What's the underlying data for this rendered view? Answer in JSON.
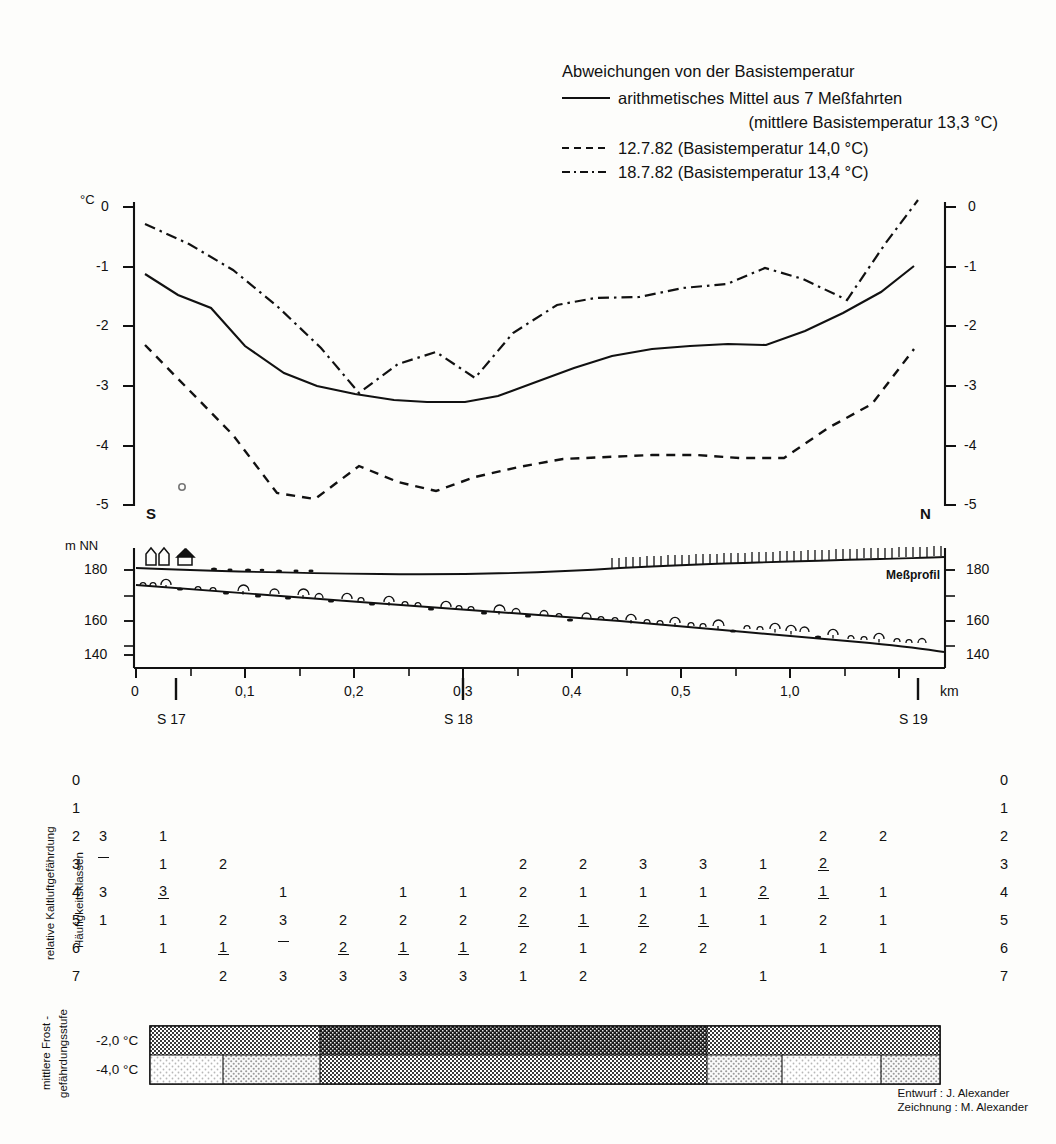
{
  "legend": {
    "title": "Abweichungen von der Basistemperatur",
    "entries": [
      {
        "style": "solid",
        "label": "arithmetisches Mittel aus 7 Meßfahrten",
        "sublabel": "(mittlere Basistemperatur 13,3 °C)"
      },
      {
        "style": "dashed",
        "label": "12.7.82 (Basistemperatur 14,0 °C)",
        "sublabel": ""
      },
      {
        "style": "dashdot",
        "label": "18.7.82 (Basistemperatur 13,4 °C)",
        "sublabel": ""
      }
    ]
  },
  "temp_panel": {
    "unit_label": "°C",
    "y_ticks_left": [
      "0",
      "-1",
      "-2",
      "-3",
      "-4",
      "-5"
    ],
    "y_ticks_right": [
      "0",
      "-1",
      "-2",
      "-3",
      "-4",
      "-5"
    ],
    "direction_left": "S",
    "direction_right": "N"
  },
  "profile_panel": {
    "unit_label": "m NN",
    "y_ticks_left": [
      "180",
      "160",
      "140"
    ],
    "y_ticks_right": [
      "180",
      "160",
      "140"
    ],
    "profile_label": "Meßprofil"
  },
  "x_axis": {
    "unit": "km",
    "ticks": [
      {
        "value": 0,
        "label": "0"
      },
      {
        "value": 0.1,
        "label": "0,1"
      },
      {
        "value": 0.2,
        "label": "0,2"
      },
      {
        "value": 0.3,
        "label": "0,3"
      },
      {
        "value": 0.4,
        "label": "0,4"
      },
      {
        "value": 0.5,
        "label": "0,5"
      },
      {
        "value": 1.0,
        "label": "1,0"
      }
    ],
    "stations": [
      {
        "label": "S 17",
        "value": 0.07
      },
      {
        "label": "S 18",
        "value": 0.565
      },
      {
        "label": "S 19",
        "value": 1.39
      }
    ]
  },
  "freq_table": {
    "side_label_outer": "relative Kaltluftgefährdung",
    "side_label_inner": "Häufigkeitsklassen",
    "row_labels": [
      "0",
      "1",
      "2",
      "3",
      "4",
      "5",
      "6",
      "7"
    ],
    "columns": 16,
    "cells": [
      {
        "row": 2,
        "col": 0,
        "type": "int",
        "value": "3"
      },
      {
        "row": 2,
        "col": 1,
        "type": "int",
        "value": "1"
      },
      {
        "row": 2,
        "col": 12,
        "type": "int",
        "value": "2"
      },
      {
        "row": 2,
        "col": 13,
        "type": "int",
        "value": "2"
      },
      {
        "row": 3,
        "col": 0,
        "type": "fracnum",
        "num": "",
        "den": ""
      },
      {
        "row": 3,
        "col": 1,
        "type": "int",
        "value": "1"
      },
      {
        "row": 3,
        "col": 2,
        "type": "int",
        "value": "2"
      },
      {
        "row": 3,
        "col": 7,
        "type": "int",
        "value": "2"
      },
      {
        "row": 3,
        "col": 8,
        "type": "int",
        "value": "2"
      },
      {
        "row": 3,
        "col": 9,
        "type": "int",
        "value": "3"
      },
      {
        "row": 3,
        "col": 10,
        "type": "int",
        "value": "3"
      },
      {
        "row": 3,
        "col": 11,
        "type": "int",
        "value": "1"
      },
      {
        "row": 3,
        "col": 12,
        "type": "fracnum",
        "num": "2",
        "den": ""
      },
      {
        "row": 3,
        "col": 13,
        "type": "int",
        "value": ""
      },
      {
        "row": 4,
        "col": 0,
        "type": "int",
        "value": "3"
      },
      {
        "row": 4,
        "col": 1,
        "type": "fracnum",
        "num": "3",
        "den": ""
      },
      {
        "row": 4,
        "col": 3,
        "type": "int",
        "value": "1"
      },
      {
        "row": 4,
        "col": 5,
        "type": "int",
        "value": "1"
      },
      {
        "row": 4,
        "col": 6,
        "type": "int",
        "value": "1"
      },
      {
        "row": 4,
        "col": 7,
        "type": "int",
        "value": "2"
      },
      {
        "row": 4,
        "col": 8,
        "type": "int",
        "value": "1"
      },
      {
        "row": 4,
        "col": 9,
        "type": "int",
        "value": "1"
      },
      {
        "row": 4,
        "col": 10,
        "type": "int",
        "value": "1"
      },
      {
        "row": 4,
        "col": 11,
        "type": "fracnum",
        "num": "2",
        "den": ""
      },
      {
        "row": 4,
        "col": 12,
        "type": "fracnum",
        "num": "1",
        "den": ""
      },
      {
        "row": 4,
        "col": 13,
        "type": "int",
        "value": "1"
      },
      {
        "row": 5,
        "col": 0,
        "type": "int",
        "value": "1"
      },
      {
        "row": 5,
        "col": 1,
        "type": "int",
        "value": "1"
      },
      {
        "row": 5,
        "col": 2,
        "type": "int",
        "value": "2"
      },
      {
        "row": 5,
        "col": 3,
        "type": "int",
        "value": "3"
      },
      {
        "row": 5,
        "col": 4,
        "type": "int",
        "value": "2"
      },
      {
        "row": 5,
        "col": 5,
        "type": "int",
        "value": "2"
      },
      {
        "row": 5,
        "col": 6,
        "type": "int",
        "value": "2"
      },
      {
        "row": 5,
        "col": 7,
        "type": "fracnum",
        "num": "2",
        "den": ""
      },
      {
        "row": 5,
        "col": 8,
        "type": "fracnum",
        "num": "1",
        "den": ""
      },
      {
        "row": 5,
        "col": 9,
        "type": "fracnum",
        "num": "2",
        "den": ""
      },
      {
        "row": 5,
        "col": 10,
        "type": "fracnum",
        "num": "1",
        "den": ""
      },
      {
        "row": 5,
        "col": 11,
        "type": "int",
        "value": "1"
      },
      {
        "row": 5,
        "col": 12,
        "type": "int",
        "value": "2"
      },
      {
        "row": 5,
        "col": 13,
        "type": "int",
        "value": "1"
      },
      {
        "row": 6,
        "col": 1,
        "type": "int",
        "value": "1"
      },
      {
        "row": 6,
        "col": 2,
        "type": "fracnum",
        "num": "1",
        "den": ""
      },
      {
        "row": 6,
        "col": 3,
        "type": "fracnum",
        "num": "",
        "den": ""
      },
      {
        "row": 6,
        "col": 4,
        "type": "fracnum",
        "num": "2",
        "den": ""
      },
      {
        "row": 6,
        "col": 5,
        "type": "fracnum",
        "num": "1",
        "den": ""
      },
      {
        "row": 6,
        "col": 6,
        "type": "fracnum",
        "num": "1",
        "den": ""
      },
      {
        "row": 6,
        "col": 7,
        "type": "int",
        "value": "2"
      },
      {
        "row": 6,
        "col": 8,
        "type": "int",
        "value": "1"
      },
      {
        "row": 6,
        "col": 9,
        "type": "int",
        "value": "2"
      },
      {
        "row": 6,
        "col": 10,
        "type": "int",
        "value": "2"
      },
      {
        "row": 6,
        "col": 12,
        "type": "int",
        "value": "1"
      },
      {
        "row": 6,
        "col": 13,
        "type": "int",
        "value": "1"
      },
      {
        "row": 7,
        "col": 2,
        "type": "int",
        "value": "2"
      },
      {
        "row": 7,
        "col": 3,
        "type": "int",
        "value": "3"
      },
      {
        "row": 7,
        "col": 4,
        "type": "int",
        "value": "3"
      },
      {
        "row": 7,
        "col": 5,
        "type": "int",
        "value": "3"
      },
      {
        "row": 7,
        "col": 6,
        "type": "int",
        "value": "3"
      },
      {
        "row": 7,
        "col": 7,
        "type": "int",
        "value": "1"
      },
      {
        "row": 7,
        "col": 8,
        "type": "int",
        "value": "2"
      },
      {
        "row": 7,
        "col": 11,
        "type": "int",
        "value": "1"
      }
    ]
  },
  "frost_panel": {
    "side_label": "mittlere Frost -\ngefährdungsstufe",
    "row_labels": [
      "-2,0 °C",
      "-4,0 °C"
    ],
    "top_segments": [
      {
        "start": 0.0,
        "end": 0.215,
        "shade": "mid"
      },
      {
        "start": 0.215,
        "end": 0.705,
        "shade": "dark"
      },
      {
        "start": 0.705,
        "end": 1.0,
        "shade": "mid"
      }
    ],
    "bottom_segments": [
      {
        "start": 0.0,
        "end": 0.092,
        "shade": "light"
      },
      {
        "start": 0.092,
        "end": 0.215,
        "shade": "light2"
      },
      {
        "start": 0.215,
        "end": 0.705,
        "shade": "mid"
      },
      {
        "start": 0.705,
        "end": 0.8,
        "shade": "light2"
      },
      {
        "start": 0.8,
        "end": 0.925,
        "shade": "light"
      },
      {
        "start": 0.925,
        "end": 1.0,
        "shade": "light2"
      }
    ]
  },
  "credits": {
    "line1": "Entwurf : J. Alexander",
    "line2": "Zeichnung : M. Alexander"
  },
  "chart_data": {
    "type": "line",
    "title": "Abweichungen von der Basistemperatur",
    "xlabel": "km",
    "ylabel": "°C",
    "xlim": [
      0,
      1.48
    ],
    "ylim": [
      -5.3,
      0.3
    ],
    "grid": false,
    "legend_position": "top-right",
    "series": [
      {
        "name": "arithmetisches Mittel aus 7 Meßfahrten",
        "style": "solid",
        "base_temperature": 13.3,
        "x": [
          0.02,
          0.08,
          0.14,
          0.2,
          0.27,
          0.33,
          0.4,
          0.47,
          0.53,
          0.6,
          0.66,
          0.73,
          0.8,
          0.87,
          0.94,
          1.01,
          1.08,
          1.15,
          1.22,
          1.29,
          1.36,
          1.42
        ],
        "y": [
          -1.12,
          -1.48,
          -1.7,
          -2.35,
          -2.8,
          -3.02,
          -3.15,
          -3.25,
          -3.28,
          -3.28,
          -3.18,
          -2.95,
          -2.72,
          -2.52,
          -2.4,
          -2.35,
          -2.32,
          -2.33,
          -2.1,
          -1.8,
          -1.45,
          -1.0
        ]
      },
      {
        "name": "12.7.82",
        "style": "dashed",
        "base_temperature": 14.0,
        "x": [
          0.02,
          0.1,
          0.18,
          0.26,
          0.33,
          0.41,
          0.48,
          0.55,
          0.62,
          0.7,
          0.78,
          0.86,
          0.94,
          1.02,
          1.1,
          1.18,
          1.26,
          1.34,
          1.42
        ],
        "y": [
          -2.3,
          -3.05,
          -3.8,
          -4.78,
          -4.88,
          -4.32,
          -4.6,
          -4.75,
          -4.52,
          -4.35,
          -4.22,
          -4.18,
          -4.15,
          -4.15,
          -4.2,
          -4.2,
          -3.7,
          -3.3,
          -2.38
        ]
      },
      {
        "name": "18.7.82",
        "style": "dashdot",
        "base_temperature": 13.4,
        "x": [
          0.02,
          0.1,
          0.18,
          0.26,
          0.34,
          0.41,
          0.48,
          0.55,
          0.62,
          0.69,
          0.77,
          0.84,
          0.92,
          1.0,
          1.08,
          1.15,
          1.22,
          1.3,
          1.37,
          1.43
        ],
        "y": [
          -0.28,
          -0.62,
          -1.05,
          -1.65,
          -2.35,
          -3.1,
          -2.62,
          -2.42,
          -2.85,
          -2.1,
          -1.65,
          -1.52,
          -1.5,
          -1.35,
          -1.28,
          -1.02,
          -1.2,
          -1.55,
          -0.62,
          0.12
        ]
      }
    ],
    "elevation_profile": {
      "ylabel": "m NN",
      "ylim": [
        132,
        188
      ],
      "upper_name": "Meßprofil",
      "upper_x": [
        0.0,
        0.2,
        0.4,
        0.6,
        0.8,
        1.0,
        1.2,
        1.48
      ],
      "upper_y": [
        180.5,
        179.5,
        179.0,
        178.5,
        180.0,
        181.5,
        182.0,
        183.0
      ],
      "lower_x": [
        0.0,
        0.2,
        0.4,
        0.6,
        0.8,
        1.0,
        1.2,
        1.48
      ],
      "lower_y": [
        170.0,
        167.0,
        163.0,
        159.0,
        155.5,
        152.0,
        148.0,
        142.5
      ]
    }
  }
}
